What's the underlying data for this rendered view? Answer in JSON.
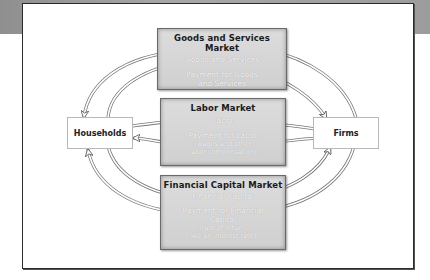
{
  "diagram": {
    "type": "circular-flow",
    "markets": [
      {
        "title": "Goods and Services Market",
        "lines": [
          "Goods and Services",
          "Payment for Goods",
          "and Services"
        ]
      },
      {
        "title": "Labor Market",
        "lines": [
          "Labor",
          "Payment for Labor",
          "(wages and other",
          "labor compensation)"
        ]
      },
      {
        "title": "Financial Capital Market",
        "lines": [
          "Financial Capital",
          "Payment for Financial",
          "Capital",
          "(rate of return,",
          "like an interest rate)"
        ]
      }
    ],
    "agents": {
      "left": "Households",
      "right": "Firms"
    },
    "flows": [
      {
        "from": "Goods and Services",
        "to": "Households"
      },
      {
        "from": "Households",
        "to": "Payment for Goods and Services"
      },
      {
        "from": "Payment for Goods and Services",
        "to": "Firms"
      },
      {
        "from": "Firms",
        "to": "Goods and Services"
      },
      {
        "from": "Households",
        "to": "Labor"
      },
      {
        "from": "Labor",
        "to": "Firms"
      },
      {
        "from": "Firms",
        "to": "Payment for Labor"
      },
      {
        "from": "Payment for Labor",
        "to": "Households"
      },
      {
        "from": "Households",
        "to": "Financial Capital"
      },
      {
        "from": "Financial Capital",
        "to": "Firms"
      },
      {
        "from": "Firms",
        "to": "Payment for Financial Capital"
      },
      {
        "from": "Payment for Financial Capital",
        "to": "Households"
      }
    ]
  }
}
